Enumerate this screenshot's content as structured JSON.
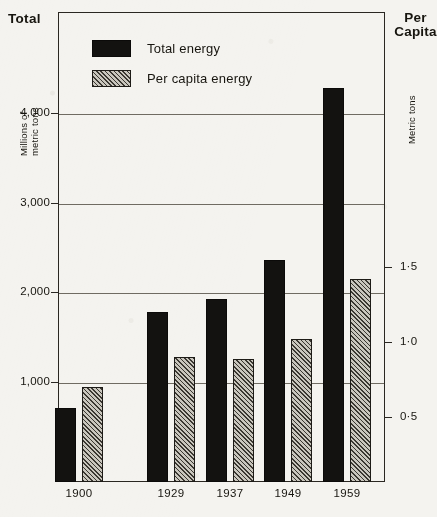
{
  "axes": {
    "left_title": "Total",
    "left_unit": "Millions of\nmetric tons",
    "left_unit_line1": "Millions of",
    "left_unit_line2": "metric tons",
    "right_title_line1": "Per",
    "right_title_line2": "Capita",
    "right_unit": "Metric tons"
  },
  "legend": {
    "items": [
      {
        "label": "Total energy",
        "swatch": "solid-black-swatch",
        "color": "#131210"
      },
      {
        "label": "Per capita energy",
        "swatch": "hatched-swatch",
        "color": "#c9c6bd"
      }
    ]
  },
  "chart_data": {
    "type": "bar",
    "title": "",
    "xlabel": "",
    "ylabel": "Millions of metric tons",
    "categories": [
      "1900",
      "1929",
      "1937",
      "1949",
      "1959"
    ],
    "series": [
      {
        "name": "Total energy",
        "axis": "left",
        "unit": "Millions of metric tons",
        "values": [
          710,
          1780,
          1930,
          2360,
          4280
        ]
      },
      {
        "name": "Per capita energy",
        "axis": "right",
        "unit": "Metric tons",
        "values": [
          0.7,
          0.9,
          0.89,
          1.02,
          1.42
        ]
      }
    ],
    "left_axis": {
      "ticks": [
        "1,000",
        "2,000",
        "3,000",
        "4,000"
      ],
      "tick_values": [
        1000,
        2000,
        3000,
        4000
      ],
      "ylim": [
        0,
        5230
      ],
      "label": "Millions of metric tons"
    },
    "right_axis": {
      "ticks": [
        "0·5",
        "1·0",
        "1·5"
      ],
      "tick_values": [
        0.5,
        1.0,
        1.5
      ],
      "ylim": [
        0,
        1.79
      ],
      "label": "Metric tons"
    },
    "grid": "horizontal",
    "legend_position": "top-left-inside"
  }
}
